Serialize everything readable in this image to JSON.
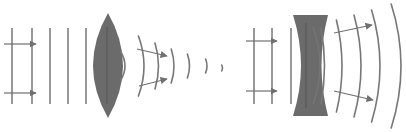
{
  "colors": {
    "background": "#ffffff",
    "lens_fill": "#6b6b6b",
    "lens_core": "#555555",
    "wave": "#777777",
    "arrow": "#707070"
  },
  "panels": [
    {
      "id": "convex",
      "label": "converging lens",
      "incoming_wavefronts_x": [
        12,
        32,
        50,
        68,
        86
      ],
      "wavefront_y": [
        28,
        104
      ],
      "incoming_rays": [
        {
          "x1": 4,
          "y1": 44,
          "x2": 36,
          "y2": 44
        },
        {
          "x1": 4,
          "y1": 93,
          "x2": 36,
          "y2": 93
        }
      ],
      "lens": {
        "cx": 108,
        "top": 13,
        "bottom": 118,
        "half_width": 15
      },
      "outgoing_wavefronts": [
        {
          "x": 122,
          "rx": 6,
          "half_h": 14,
          "cy": 66,
          "note": "on lens edge"
        },
        {
          "x": 140,
          "rx": 8,
          "half_h": 30,
          "cy": 66
        },
        {
          "x": 156,
          "rx": 5,
          "half_h": 23,
          "cy": 66
        },
        {
          "x": 172,
          "rx": 4,
          "half_h": 17,
          "cy": 66
        },
        {
          "x": 188,
          "rx": 3,
          "half_h": 12,
          "cy": 66
        },
        {
          "x": 206,
          "rx": 2,
          "half_h": 7,
          "cy": 66
        },
        {
          "x": 222,
          "rx": 1,
          "half_h": 3,
          "cy": 68
        }
      ],
      "outgoing_rays": [
        {
          "x1": 137,
          "y1": 49,
          "x2": 167,
          "y2": 56
        },
        {
          "x1": 139,
          "y1": 86,
          "x2": 167,
          "y2": 79
        }
      ]
    },
    {
      "id": "concave",
      "label": "diverging lens",
      "incoming_wavefronts_x": [
        254,
        272,
        291
      ],
      "wavefront_y": [
        28,
        104
      ],
      "incoming_rays": [
        {
          "x1": 246,
          "y1": 41,
          "x2": 277,
          "y2": 41
        },
        {
          "x1": 246,
          "y1": 91,
          "x2": 277,
          "y2": 91
        }
      ],
      "lens": {
        "left": 293,
        "right": 328,
        "top": 15,
        "bottom": 116,
        "waist_left": 303,
        "waist_right": 321
      },
      "outgoing_wavefronts": [
        {
          "x": 322,
          "rx": 5,
          "half_h": 38,
          "cy": 66
        },
        {
          "x": 338,
          "rx": 8,
          "half_h": 46,
          "cy": 66
        },
        {
          "x": 356,
          "rx": 10,
          "half_h": 51,
          "cy": 66
        },
        {
          "x": 374,
          "rx": 12,
          "half_h": 56,
          "cy": 66
        },
        {
          "x": 394,
          "rx": 14,
          "half_h": 62,
          "cy": 66
        }
      ],
      "outgoing_rays": [
        {
          "x1": 334,
          "y1": 33,
          "x2": 372,
          "y2": 25
        },
        {
          "x1": 334,
          "y1": 91,
          "x2": 373,
          "y2": 100
        }
      ]
    }
  ]
}
